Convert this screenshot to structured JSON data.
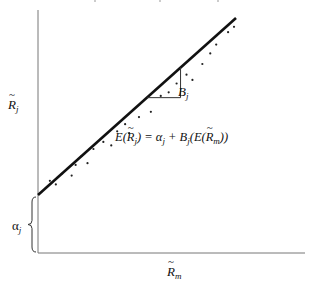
{
  "diagram": {
    "y_axis_label": {
      "symbol": "R",
      "subscript": "j",
      "tilde": true
    },
    "x_axis_label": {
      "symbol": "R",
      "subscript": "m",
      "tilde": true
    },
    "intercept_label": {
      "symbol": "α",
      "subscript": "j"
    },
    "slope_label": {
      "symbol": "B",
      "subscript": "j"
    },
    "equation": {
      "lhs": "E(R̃j)",
      "text": "E(R̃j) = αj + Bj(E(R̃m))",
      "parts": [
        {
          "t": "E(",
          "sub": ""
        },
        {
          "t": "R",
          "sub": "j",
          "tilde": true
        },
        {
          "t": ") = α",
          "sub": "j"
        },
        {
          "t": " + B",
          "sub": "j"
        },
        {
          "t": "(E(",
          "sub": ""
        },
        {
          "t": "R",
          "sub": "m",
          "tilde": true
        },
        {
          "t": "))",
          "sub": ""
        }
      ]
    },
    "regression_line": {
      "x_start": 0.0,
      "y_start": 0.0,
      "x_end": 1.0,
      "y_end": 1.0
    },
    "scatter_points": [
      [
        0.06,
        0.08
      ],
      [
        0.09,
        0.06
      ],
      [
        0.12,
        0.12
      ],
      [
        0.17,
        0.11
      ],
      [
        0.19,
        0.17
      ],
      [
        0.22,
        0.22
      ],
      [
        0.25,
        0.18
      ],
      [
        0.28,
        0.26
      ],
      [
        0.33,
        0.3
      ],
      [
        0.37,
        0.28
      ],
      [
        0.4,
        0.36
      ],
      [
        0.44,
        0.4
      ],
      [
        0.46,
        0.35
      ],
      [
        0.51,
        0.44
      ],
      [
        0.57,
        0.47
      ],
      [
        0.62,
        0.56
      ],
      [
        0.66,
        0.58
      ],
      [
        0.7,
        0.63
      ],
      [
        0.75,
        0.68
      ],
      [
        0.78,
        0.65
      ],
      [
        0.83,
        0.74
      ],
      [
        0.87,
        0.8
      ],
      [
        0.9,
        0.85
      ],
      [
        0.96,
        0.92
      ],
      [
        0.99,
        0.95
      ]
    ],
    "slope_triangle": {
      "x_from": 0.55,
      "x_to": 0.72
    }
  }
}
